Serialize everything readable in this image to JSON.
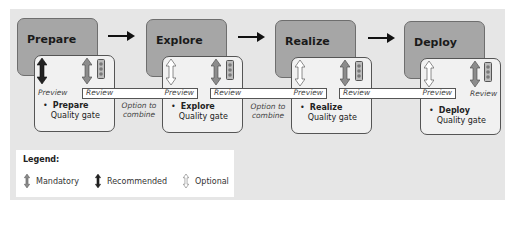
{
  "phases": [
    {
      "label": "Prepare",
      "gate_name": "Prepare",
      "gate_text": "Quality gate"
    },
    {
      "label": "Explore",
      "gate_name": "Explore",
      "gate_text": "Quality gate"
    },
    {
      "label": "Realize",
      "gate_name": "Realize",
      "gate_text": "Quality gate"
    },
    {
      "label": "Deploy",
      "gate_name": "Deploy",
      "gate_text": "Quality gate"
    }
  ],
  "bullet": "•",
  "labels": {
    "preview": "Preview",
    "review": "Review",
    "option_line1": "Option to",
    "option_line2": "combine"
  },
  "legend": {
    "title": "Legend:",
    "items": [
      {
        "icon": "mandatory-arrow-icon",
        "label": "Mandatory"
      },
      {
        "icon": "recommended-arrow-icon",
        "label": "Recommended"
      },
      {
        "icon": "optional-arrow-icon",
        "label": "Optional"
      }
    ]
  },
  "colors": {
    "panel": "#e6e6e6",
    "phase_box": "#a6a6a6",
    "gate_box": "#f1f1f1",
    "mandatory": "#8c8c8c",
    "recommended": "#222222",
    "optional": "#ffffff"
  }
}
